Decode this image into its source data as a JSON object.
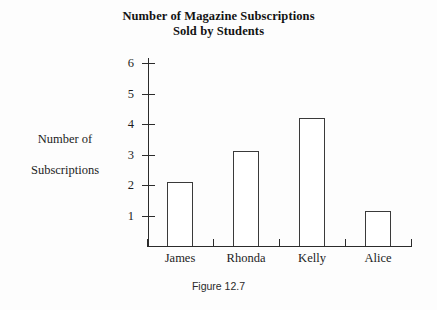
{
  "chart_data": {
    "type": "bar",
    "title": "Number of Magazine Subscriptions Sold by Students",
    "title_lines": [
      "Number of Magazine Subscriptions",
      "Sold by Students"
    ],
    "categories": [
      "James",
      "Rhonda",
      "Kelly",
      "Alice"
    ],
    "values": [
      2.1,
      3.1,
      4.2,
      1.15
    ],
    "xlabel": "",
    "ylabel": "Number of Subscriptions",
    "ylabel_lines": [
      "Number of",
      "Subscriptions"
    ],
    "ylim": [
      0,
      6.5
    ],
    "yticks": [
      6,
      5,
      4,
      3,
      2,
      1
    ],
    "ytick_labels": [
      "6",
      "5",
      "4",
      "3",
      "2",
      "1"
    ],
    "grid": false,
    "legend": false,
    "bar_fill": "#ffffff",
    "bar_outline": "#3a3a3a",
    "axis_color": "#2b2b2b"
  },
  "caption": "Figure 12.7"
}
